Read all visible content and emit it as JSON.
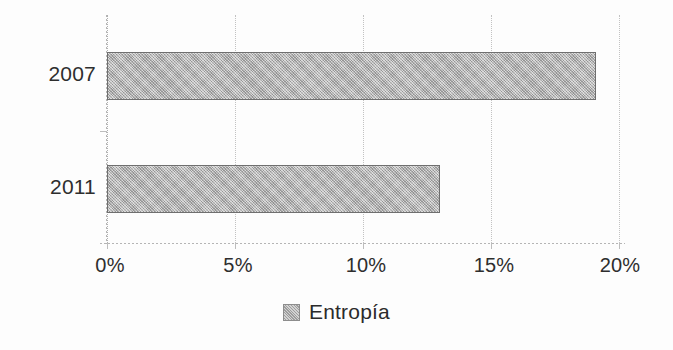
{
  "chart_data": {
    "type": "bar",
    "orientation": "horizontal",
    "title": "",
    "subtitle": "",
    "xlabel": "",
    "ylabel": "",
    "categories": [
      "2007",
      "2011"
    ],
    "series": [
      {
        "name": "Entropía",
        "values": [
          19.1,
          13.0
        ],
        "color": "#a9a9a9"
      }
    ],
    "xlim": [
      0,
      20
    ],
    "xticks": [
      0,
      5,
      10,
      15,
      20
    ],
    "xtick_labels": [
      "0%",
      "5%",
      "10%",
      "15%",
      "20%"
    ],
    "value_format": "percent",
    "grid": {
      "vertical": true,
      "horizontal": false,
      "style": "dotted",
      "color": "#c2c2c2"
    },
    "legend": {
      "position": "bottom",
      "entries": [
        {
          "label": "Entropía",
          "swatch_color": "#aeaeae"
        }
      ]
    },
    "axis": {
      "category_axis_color": "#b5b5b5",
      "value_axis_color": "#b5b5b5"
    },
    "background_color": "#fdfdfd"
  },
  "ticks": {
    "t0": "0%",
    "t1": "5%",
    "t2": "10%",
    "t3": "15%",
    "t4": "20%"
  },
  "categories": {
    "c0": "2007",
    "c1": "2011"
  },
  "legend": {
    "entry0": "Entropía"
  }
}
